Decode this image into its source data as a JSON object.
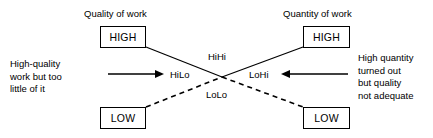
{
  "diagram": {
    "type": "2x2-matrix-crossed-lines",
    "axis_titles": {
      "left": "Quality of work",
      "right": "Quantity of work"
    },
    "boxes": {
      "top_left": "HIGH",
      "top_right": "HIGH",
      "bottom_left": "LOW",
      "bottom_right": "LOW"
    },
    "center_labels": {
      "top": "HiHi",
      "left": "HiLo",
      "right": "LoHi",
      "bottom": "LoLo"
    },
    "annotations": {
      "left": "High-quality\nwork but too\nlittle of it",
      "right": "High quantity\nturned out\nbut quality\nnot adequate"
    },
    "colors": {
      "stroke": "#000000",
      "background": "#ffffff",
      "text": "#000000"
    }
  }
}
